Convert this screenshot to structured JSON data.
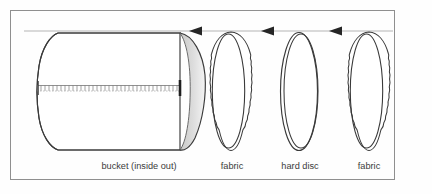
{
  "figure": {
    "border_color": "#8c8c8c",
    "ink_color": "#3a3a3a",
    "shade_color": "#d8d8d6",
    "background": "#fefefe",
    "labels": [
      {
        "id": "bucket",
        "text": "bucket (inside out)",
        "x": 139,
        "y": 166
      },
      {
        "id": "fabric-front",
        "text": "fabric",
        "x": 232,
        "y": 166
      },
      {
        "id": "hard-disc",
        "text": "hard disc",
        "x": 300,
        "y": 166
      },
      {
        "id": "fabric-back",
        "text": "fabric",
        "x": 369,
        "y": 166
      }
    ],
    "parts": [
      {
        "id": "bucket",
        "kind": "cylinder",
        "label": "bucket (inside out)"
      },
      {
        "id": "fabric-front",
        "kind": "scalloped-disc",
        "label": "fabric"
      },
      {
        "id": "hard-disc",
        "kind": "smooth-disc",
        "label": "hard disc"
      },
      {
        "id": "fabric-back",
        "kind": "scalloped-disc",
        "label": "fabric"
      }
    ],
    "assembly_arrows": {
      "count": 3,
      "direction": "left",
      "guide_line_y": 31,
      "guide_line_x_start": 24,
      "guide_line_x_end": 393,
      "arrow_x": [
        200,
        272,
        340
      ]
    },
    "stitch_band": {
      "y": 88,
      "x_start": 37,
      "x_end": 180,
      "style": "dotted"
    }
  }
}
